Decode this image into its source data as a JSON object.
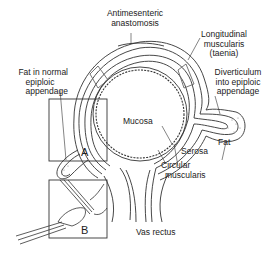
{
  "diagram": {
    "labels": {
      "antimesenteric_1": "Antimesenteric",
      "antimesenteric_2": "anastomosis",
      "longitudinal_1": "Longitudinal",
      "longitudinal_2": "muscularis",
      "longitudinal_3": "(taenia)",
      "fat_normal_1": "Fat in normal",
      "fat_normal_2": "epiploic",
      "fat_normal_3": "appendage",
      "diverticulum_1": "Diverticulum",
      "diverticulum_2": "into epiploic",
      "diverticulum_3": "appendage",
      "mucosa": "Mucosa",
      "fat": "Fat",
      "serosa": "Serosa",
      "circular_1": "Circular",
      "circular_2": "muscularis",
      "vas_rectus": "Vas rectus"
    },
    "insets": [
      {
        "id": "A",
        "label": "A"
      },
      {
        "id": "B",
        "label": "B"
      }
    ],
    "colors": {
      "line": "#333333",
      "background": "#ffffff",
      "stipple": "#888888"
    }
  }
}
